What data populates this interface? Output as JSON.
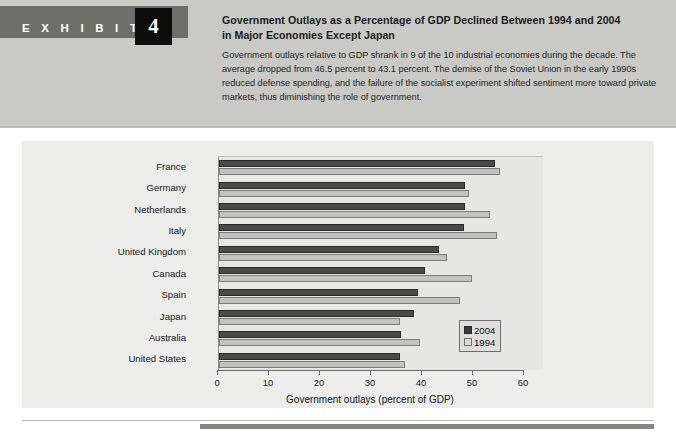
{
  "exhibit": {
    "word": "E X H I B I T",
    "number": "4"
  },
  "header": {
    "title_line1": "Government Outlays as a Percentage of GDP Declined Between 1994 and 2004",
    "title_line2": "in Major Economies Except Japan",
    "body": "Government outlays relative to GDP shrank in 9 of the 10 industrial economies during the decade. The average dropped from 46.5 percent to 43.1 percent. The demise of the Soviet Union in the early 1990s reduced defense spending, and the failure of the socialist experiment shifted sentiment more toward private markets, thus diminishing the role of government."
  },
  "colors": {
    "band": "#c9cac6",
    "panel": "#ececea",
    "bar_2004": "#4a4a4a",
    "bar_1994": "#c2c2c0",
    "exhibit_tag": "#6e6f6b",
    "exhibit_number_box": "#0d0d0d",
    "footer_rule": "#85867f"
  },
  "chart_data": {
    "type": "bar",
    "orientation": "horizontal",
    "title": "",
    "xlabel": "Government outlays (percent of GDP)",
    "ylabel": "",
    "xlim": [
      0,
      60
    ],
    "xticks": [
      0,
      10,
      20,
      30,
      40,
      50,
      60
    ],
    "xticklabels": [
      "0",
      "10",
      "20",
      "30",
      "40",
      "50",
      "60"
    ],
    "grid": false,
    "legend_position": "inside-lower-right",
    "categories": [
      "France",
      "Germany",
      "Netherlands",
      "Italy",
      "United Kingdom",
      "Canada",
      "Spain",
      "Japan",
      "Australia",
      "United States"
    ],
    "series": [
      {
        "name": "2004",
        "color": "#4a4a4a",
        "values": [
          54.2,
          48.3,
          48.3,
          48.0,
          43.2,
          40.4,
          39.0,
          38.3,
          35.7,
          35.5
        ]
      },
      {
        "name": "1994",
        "color": "#c2c2c0",
        "values": [
          55.0,
          49.0,
          53.2,
          54.5,
          44.8,
          49.7,
          47.3,
          35.5,
          39.4,
          36.5
        ]
      }
    ]
  }
}
